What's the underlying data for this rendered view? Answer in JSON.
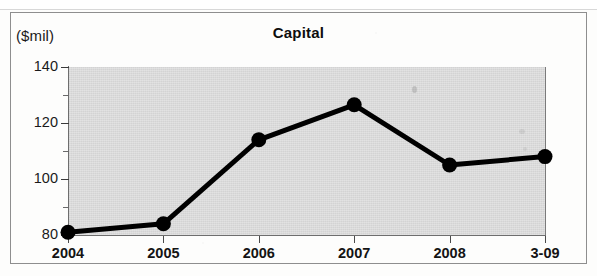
{
  "figure": {
    "unit_label": "($mil)",
    "title": "Capital"
  },
  "chart_data": {
    "type": "line",
    "title": "Capital",
    "subtitle": "",
    "xlabel": "",
    "ylabel": "($mil)",
    "unit": "$mil",
    "categories": [
      "2004",
      "2005",
      "2006",
      "2007",
      "2008",
      "3-09"
    ],
    "values": [
      81,
      84,
      114,
      126.5,
      105,
      108
    ],
    "series": [
      {
        "name": "Capital",
        "values": [
          81,
          84,
          114,
          126.5,
          105,
          108
        ]
      }
    ],
    "ylim": [
      80,
      140
    ],
    "y_major_ticks": [
      80,
      100,
      120,
      140
    ],
    "y_minor_ticks": [
      90,
      110,
      130
    ],
    "y_tick_labels": [
      "80",
      "100",
      "120",
      "140"
    ],
    "x_tick_labels": [
      "2004",
      "2005",
      "2006",
      "2007",
      "2008",
      "3-09"
    ],
    "grid": false,
    "legend": false,
    "legend_position": "none",
    "plot_background_color": "#d3d3d3",
    "line_color": "#000000",
    "marker": "circle",
    "marker_color": "#000000"
  }
}
